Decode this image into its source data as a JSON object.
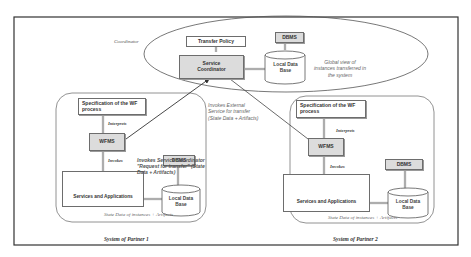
{
  "coordinator": {
    "label": "Coordinator",
    "transfer_policy": "Transfer Policy",
    "service_coordinator_line1": "Service",
    "service_coordinator_line2": "Coordinator",
    "dbms": "DBMS",
    "local_db_line1": "Local Data",
    "local_db_line2": "Base",
    "global_view_line1": "Global view of",
    "global_view_line2": "instances transferred in",
    "global_view_line3": "the system"
  },
  "partner1": {
    "spec_line1": "Specification of the WF",
    "spec_line2": "process",
    "interprets": "Interprets",
    "wfms": "WFMS",
    "invokes": "Invokes",
    "services": "Services and Applications",
    "dbms": "DBMS",
    "local_db_line1": "Local Data",
    "local_db_line2": "Base",
    "state_data": "State Data of instances + Artifacts",
    "caption": "System of Partner 1"
  },
  "partner2": {
    "spec_line1": "Specification of the WF",
    "spec_line2": "process",
    "interprets": "Interprets",
    "wfms": "WFMS",
    "invokes": "Invokes",
    "services": "Services and Applications",
    "dbms": "DBMS",
    "local_db_line1": "Local Data",
    "local_db_line2": "Base",
    "state_data": "State Data of instances + Artifacts",
    "caption": "System of Partner 2"
  },
  "annotations": {
    "invokes_coordinator_line1": "Invokes Service Coordinator",
    "invokes_coordinator_line2": "\"Request for transfer\" (State",
    "invokes_coordinator_line3": "Data + Artifacts)",
    "invokes_external_line1": "Invokes  External",
    "invokes_external_line2": "Service for  transfer",
    "invokes_external_line3": "(State Data + Artifacts)"
  }
}
